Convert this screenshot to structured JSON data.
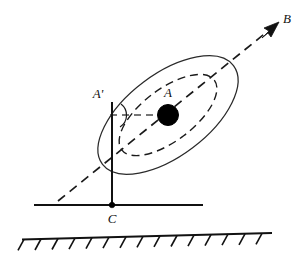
{
  "figure": {
    "background_color": "#ffffff",
    "stroke_color": "#1a1a1a",
    "fill_color": "#000000",
    "labels": {
      "point_a": "A",
      "point_a_prime": "A'",
      "point_b": "B",
      "point_c": "C"
    },
    "elements": {
      "outer_ellipse_name": "outer-ellipse",
      "inner_ellipse_name": "inner-dashed-ellipse",
      "axis_arrow_name": "axis-arrow-ab",
      "vertical_line_name": "vertical-line-a-prime-c",
      "horizontal_dashed_name": "horizontal-dashed-a-prime-a",
      "ground_line_name": "ground-line",
      "hatched_line_name": "hatched-ground",
      "angle_arc_name": "angle-arc",
      "mass_name": "mass-point-a",
      "pivot_name": "pivot-point-c"
    }
  },
  "geometry": {
    "outer_ellipse": {
      "cx": 168,
      "cy": 115,
      "rx": 82,
      "ry": 41,
      "rotation_deg": -37
    },
    "inner_ellipse": {
      "cx": 168,
      "cy": 115,
      "rx": 58,
      "ry": 26,
      "rotation_deg": -37
    },
    "axis_line": {
      "x1": 58,
      "y1": 201,
      "x2": 276,
      "y2": 25
    },
    "vertical_line": {
      "x": 112,
      "y1": 103,
      "y2": 207
    },
    "horizontal_dashed": {
      "x1": 112,
      "y1": 115,
      "x2": 162,
      "y2": 115
    },
    "ground_line": {
      "x1": 34,
      "y1": 205,
      "x2": 203,
      "y2": 205
    },
    "hatched_line": {
      "x1": 22,
      "y1": 239,
      "x2": 272,
      "y2": 233
    },
    "hatch_count": 15,
    "mass_circle": {
      "cx": 168,
      "cy": 115,
      "r": 10
    },
    "pivot_dot": {
      "cx": 112,
      "cy": 205,
      "r": 2.6
    },
    "angle_arc": {
      "cx": 112,
      "cy": 115,
      "r": 14
    },
    "arrow_tip": {
      "x": 276,
      "y": 25
    }
  }
}
